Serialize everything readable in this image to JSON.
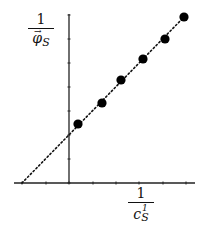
{
  "chart_data": {
    "type": "scatter",
    "title": "",
    "xlabel": "1 / c_S^1",
    "ylabel": "1 / φ_S (vector)",
    "x_tick_label": "1",
    "y_tick_label": "1",
    "grid": false,
    "legend": null,
    "points_px": [
      {
        "x": 78,
        "y": 124
      },
      {
        "x": 102,
        "y": 103
      },
      {
        "x": 121,
        "y": 80
      },
      {
        "x": 143,
        "y": 59
      },
      {
        "x": 165,
        "y": 39
      },
      {
        "x": 184,
        "y": 17
      }
    ],
    "fit_line": {
      "style": "dotted",
      "x_intercept_px": 22,
      "passes_through_last_point": true
    },
    "axes": {
      "origin_px": {
        "x": 69,
        "y": 183
      },
      "x_ticks_px": [
        22,
        46,
        69,
        93,
        116,
        139,
        163,
        186
      ],
      "y_ticks_px": [
        15,
        39,
        63,
        87,
        111,
        135,
        159,
        183
      ]
    }
  },
  "labels": {
    "y_num": "1",
    "y_den": "φ",
    "y_sub": "S",
    "x_num": "1",
    "x_den": "c",
    "x_sup": "1",
    "x_sub": "S"
  }
}
